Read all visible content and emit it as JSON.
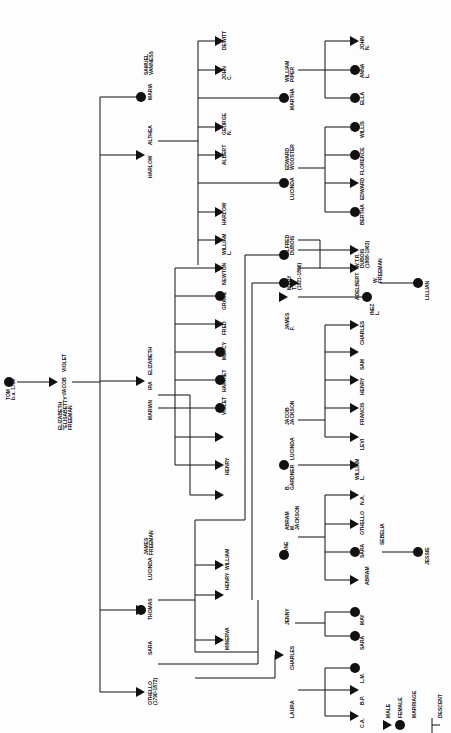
{
  "diagram": {
    "type": "genealogy-tree",
    "orientation": "rotated-90-ccw",
    "root": {
      "name": "TOM",
      "note": "b.a. 1730",
      "sex": "male"
    },
    "colors": {
      "line": "#111111",
      "background": "#fdfdfd"
    },
    "labels": [
      {
        "id": "tom",
        "text": "TOM\nb.a. 1730",
        "x": 6,
        "y": 400
      },
      {
        "id": "elizabeth",
        "text": "ELIZABETH\n\"ELISABETTY\"\nFREEMAN",
        "x": 58,
        "y": 430
      },
      {
        "id": "jacob",
        "text": "JACOB",
        "x": 62,
        "y": 395
      },
      {
        "id": "violet1",
        "text": "VIOLET",
        "x": 62,
        "y": 372
      },
      {
        "id": "harlow",
        "text": "HARLOW",
        "x": 148,
        "y": 178
      },
      {
        "id": "althea",
        "text": "ALTHEA",
        "x": 148,
        "y": 145
      },
      {
        "id": "maria",
        "text": "MARIA",
        "x": 148,
        "y": 100
      },
      {
        "id": "samuel",
        "text": "SAMUEL\nVANNESS",
        "x": 144,
        "y": 75
      },
      {
        "id": "dewitt",
        "text": "DEWITT",
        "x": 222,
        "y": 50
      },
      {
        "id": "john_c",
        "text": "JOHN\nC.",
        "x": 222,
        "y": 80
      },
      {
        "id": "martha",
        "text": "MARTHA",
        "x": 290,
        "y": 110
      },
      {
        "id": "william_piper",
        "text": "WILLIAM\nPIPER",
        "x": 285,
        "y": 82
      },
      {
        "id": "george_n",
        "text": "GEORGE\nN.",
        "x": 222,
        "y": 135
      },
      {
        "id": "albert",
        "text": "ALBERT",
        "x": 222,
        "y": 165
      },
      {
        "id": "lucinda2",
        "text": "LUCINDA",
        "x": 290,
        "y": 200
      },
      {
        "id": "edward_wooster",
        "text": "EDWARD\nWOOSTER",
        "x": 285,
        "y": 170
      },
      {
        "id": "harlow2",
        "text": "HARLOW",
        "x": 222,
        "y": 225
      },
      {
        "id": "william_l",
        "text": "WILLIAM\nL.",
        "x": 222,
        "y": 255
      },
      {
        "id": "john_n",
        "text": "JOHN\nN.",
        "x": 360,
        "y": 50
      },
      {
        "id": "anna_l",
        "text": "ANNA\nL.",
        "x": 360,
        "y": 78
      },
      {
        "id": "ella",
        "text": "ELLA",
        "x": 360,
        "y": 105
      },
      {
        "id": "willis",
        "text": "WILLIS",
        "x": 360,
        "y": 138
      },
      {
        "id": "florence",
        "text": "FLORENCE",
        "x": 360,
        "y": 175
      },
      {
        "id": "edward2",
        "text": "EDWARD",
        "x": 360,
        "y": 200
      },
      {
        "id": "bertha",
        "text": "BERTHA",
        "x": 360,
        "y": 225
      },
      {
        "id": "alfred_dubois",
        "text": "ALFRED\nDUBOIS",
        "x": 285,
        "y": 255
      },
      {
        "id": "mary_t",
        "text": "MARY\nT.\n(1821-1890)",
        "x": 287,
        "y": 290
      },
      {
        "id": "wtr_dubois",
        "text": "W.T.R.\nDUBOIS\n(1868-1963)",
        "x": 355,
        "y": 268
      },
      {
        "id": "adelbert",
        "text": "ADELBERT",
        "x": 355,
        "y": 300
      },
      {
        "id": "w_freeman",
        "text": "W.\nFREEMAN",
        "x": 373,
        "y": 283
      },
      {
        "id": "inez_l",
        "text": "INEZ\nL.",
        "x": 370,
        "y": 315
      },
      {
        "id": "lillian",
        "text": "LILLIAN",
        "x": 425,
        "y": 300
      },
      {
        "id": "james_f",
        "text": "JAMES\nF.",
        "x": 285,
        "y": 330
      },
      {
        "id": "newton",
        "text": "NEWTON",
        "x": 222,
        "y": 285
      },
      {
        "id": "grace",
        "text": "GRACE",
        "x": 222,
        "y": 310
      },
      {
        "id": "fred",
        "text": "FRED",
        "x": 222,
        "y": 335
      },
      {
        "id": "mercy",
        "text": "MERCY",
        "x": 222,
        "y": 360
      },
      {
        "id": "harriet",
        "text": "HARRIET",
        "x": 222,
        "y": 392
      },
      {
        "id": "violet2",
        "text": "VIOLET",
        "x": 222,
        "y": 415
      },
      {
        "id": "henry1",
        "text": "HENRY",
        "x": 225,
        "y": 475
      },
      {
        "id": "marian",
        "text": "MARIAN",
        "x": 148,
        "y": 420
      },
      {
        "id": "ira",
        "text": "IRA",
        "x": 148,
        "y": 390
      },
      {
        "id": "elizabeth2",
        "text": "ELIZABETH",
        "x": 148,
        "y": 375
      },
      {
        "id": "charles1",
        "text": "CHARLES",
        "x": 360,
        "y": 345
      },
      {
        "id": "sam",
        "text": "SAM",
        "x": 360,
        "y": 370
      },
      {
        "id": "henry2",
        "text": "HENRY",
        "x": 360,
        "y": 395
      },
      {
        "id": "francis",
        "text": "FRANCIS",
        "x": 360,
        "y": 425
      },
      {
        "id": "levi",
        "text": "LEVI",
        "x": 360,
        "y": 450
      },
      {
        "id": "william_l2",
        "text": "WILLIAM\nL.",
        "x": 355,
        "y": 480
      },
      {
        "id": "jacob_jackson",
        "text": "JACOB\nJACKSON",
        "x": 285,
        "y": 425
      },
      {
        "id": "lucinda3",
        "text": "LUCINDA",
        "x": 290,
        "y": 460
      },
      {
        "id": "b_gardner",
        "text": "B.\nGARDNER",
        "x": 285,
        "y": 490
      },
      {
        "id": "na",
        "text": "N.A.",
        "x": 360,
        "y": 505
      },
      {
        "id": "othello2",
        "text": "OTHELLO",
        "x": 360,
        "y": 535
      },
      {
        "id": "sara2",
        "text": "SARA",
        "x": 360,
        "y": 558
      },
      {
        "id": "abram2",
        "text": "ABRAM",
        "x": 365,
        "y": 585
      },
      {
        "id": "sebelia",
        "text": "SEBELIA",
        "x": 380,
        "y": 545
      },
      {
        "id": "jessie",
        "text": "JESSIE",
        "x": 425,
        "y": 565
      },
      {
        "id": "jane",
        "text": "JANE",
        "x": 284,
        "y": 555
      },
      {
        "id": "abram_m_jackson",
        "text": "ABRAM\nM.\nJACKSON",
        "x": 285,
        "y": 530
      },
      {
        "id": "william3",
        "text": "WILLIAM",
        "x": 225,
        "y": 570
      },
      {
        "id": "henry3",
        "text": "HENRY",
        "x": 225,
        "y": 590
      },
      {
        "id": "minerva",
        "text": "MINERVA",
        "x": 225,
        "y": 650
      },
      {
        "id": "thomas",
        "text": "THOMAS",
        "x": 148,
        "y": 620
      },
      {
        "id": "lucinda1",
        "text": "LUCINDA",
        "x": 148,
        "y": 580
      },
      {
        "id": "james_freeman",
        "text": "JAMES\nFREEMAN",
        "x": 144,
        "y": 555
      },
      {
        "id": "othello1",
        "text": "OTHELLO\n(1790-1872)",
        "x": 148,
        "y": 705
      },
      {
        "id": "sara1",
        "text": "SARA",
        "x": 148,
        "y": 655
      },
      {
        "id": "jenny",
        "text": "JENNY",
        "x": 285,
        "y": 625
      },
      {
        "id": "charles2",
        "text": "CHARLES",
        "x": 290,
        "y": 670
      },
      {
        "id": "laura",
        "text": "LAURA",
        "x": 290,
        "y": 718
      },
      {
        "id": "may",
        "text": "MAY",
        "x": 360,
        "y": 625
      },
      {
        "id": "sara3",
        "text": "SARA",
        "x": 360,
        "y": 650
      },
      {
        "id": "lm",
        "text": "L.M.",
        "x": 360,
        "y": 683
      },
      {
        "id": "bp",
        "text": "B.P.",
        "x": 360,
        "y": 705
      },
      {
        "id": "ca",
        "text": "C.A.",
        "x": 360,
        "y": 728
      }
    ],
    "legend": [
      {
        "symbol": "triangle",
        "label": "MALE"
      },
      {
        "symbol": "circle",
        "label": "FEMALE"
      },
      {
        "symbol": "double-line",
        "label": "MARRIAGE"
      },
      {
        "symbol": "tee",
        "label": "DESCENT"
      }
    ]
  }
}
